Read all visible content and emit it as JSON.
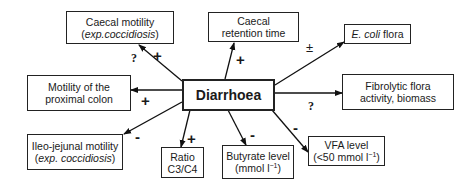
{
  "center": {
    "label": "Diarrhoea"
  },
  "nodes": {
    "caecal_motility": {
      "line1": "Caecal motility",
      "line2_pre": "(",
      "line2_italic": "exp.coccidiosis",
      "line2_post": ")",
      "sign": "+",
      "uncertain": "?"
    },
    "caecal_retention": {
      "line1": "Caecal",
      "line2": "retention time",
      "sign": "+"
    },
    "ecoli": {
      "italic": "E. coli",
      "rest": " flora",
      "sign": "±"
    },
    "fibrolytic": {
      "line1": "Fibrolytic flora",
      "line2": "activity, biomass",
      "uncertain": "?"
    },
    "proximal_colon": {
      "line1": "Motility of the",
      "line2": "proximal colon",
      "sign": "+"
    },
    "ileo_jejunal": {
      "line1": "Ileo-jejunal motility",
      "line2_pre": "(",
      "line2_italic": "exp. coccidiosis",
      "line2_post": ")",
      "sign": "-"
    },
    "ratio": {
      "line1": "Ratio",
      "line2": "C3/C4",
      "sign": "+"
    },
    "butyrate": {
      "line1": "Butyrate level",
      "line2_pre": "(mmol l",
      "line2_sup": "−1",
      "line2_post": ")",
      "sign": "-"
    },
    "vfa": {
      "line1": "VFA level",
      "line2_pre": "(<50 mmol l",
      "line2_sup": "−1",
      "line2_post": ")",
      "sign": "-"
    }
  }
}
